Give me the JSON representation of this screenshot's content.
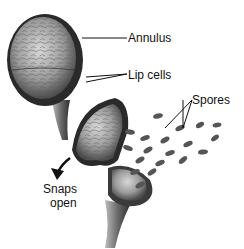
{
  "diagram": {
    "labels": {
      "annulus": "Annulus",
      "lip_cells": "Lip cells",
      "spores": "Spores",
      "snaps_line1": "Snaps",
      "snaps_line2": "open"
    },
    "colors": {
      "ink": "#111111",
      "dark": "#2a2a2a",
      "mid": "#7a7a7a",
      "light": "#c8c8c8",
      "background": "#ffffff"
    }
  }
}
